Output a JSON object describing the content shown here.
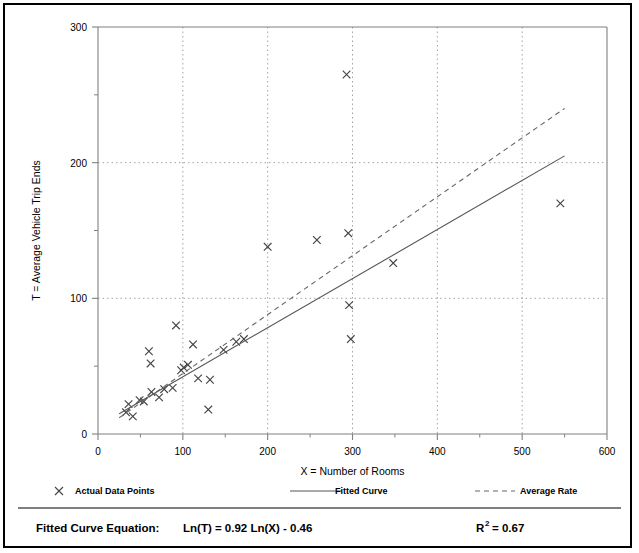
{
  "chart_data": {
    "type": "scatter",
    "title": "",
    "xlabel": "X = Number of Rooms",
    "ylabel": "T = Average Vehicle Trip Ends",
    "xlim": [
      0,
      600
    ],
    "ylim": [
      0,
      300
    ],
    "xticks": [
      0,
      100,
      200,
      300,
      400,
      500,
      600
    ],
    "yticks": [
      0,
      100,
      200,
      300
    ],
    "xminorticks": [
      50,
      150,
      250,
      350,
      450,
      550
    ],
    "yminorticks": [
      50,
      150,
      250
    ],
    "grid": true,
    "grid_style": "dotted",
    "legend_position": "below-axis",
    "series": [
      {
        "name": "Actual Data Points",
        "type": "scatter",
        "marker": "x",
        "points": [
          [
            33,
            16
          ],
          [
            36,
            22
          ],
          [
            41,
            13
          ],
          [
            49,
            25
          ],
          [
            54,
            24
          ],
          [
            60,
            61
          ],
          [
            62,
            52
          ],
          [
            63,
            31
          ],
          [
            72,
            27
          ],
          [
            78,
            33
          ],
          [
            88,
            34
          ],
          [
            92,
            80
          ],
          [
            98,
            47
          ],
          [
            101,
            49
          ],
          [
            106,
            51
          ],
          [
            112,
            66
          ],
          [
            118,
            41
          ],
          [
            130,
            18
          ],
          [
            132,
            40
          ],
          [
            148,
            62
          ],
          [
            163,
            68
          ],
          [
            172,
            70
          ],
          [
            200,
            138
          ],
          [
            258,
            143
          ],
          [
            295,
            148
          ],
          [
            293,
            265
          ],
          [
            296,
            95
          ],
          [
            298,
            70
          ],
          [
            348,
            126
          ],
          [
            545,
            170
          ]
        ]
      },
      {
        "name": "Fitted Curve",
        "type": "line",
        "style": "solid",
        "equation": "Ln(T) = 0.92 Ln(X) - 0.46",
        "points": [
          [
            25,
            15
          ],
          [
            550,
            205
          ]
        ]
      },
      {
        "name": "Average Rate",
        "type": "line",
        "style": "dashed",
        "points": [
          [
            25,
            12
          ],
          [
            550,
            240
          ]
        ]
      }
    ],
    "annotations": {
      "equation_label": "Fitted Curve Equation:",
      "equation_value": "Ln(T) = 0.92 Ln(X) - 0.46",
      "r_squared_symbol": "R",
      "r_squared_exponent": "2",
      "r_squared_value": "= 0.67"
    }
  },
  "legend": {
    "items": [
      {
        "label": "Actual Data Points",
        "marker": "x-marker-icon"
      },
      {
        "label": "Fitted Curve",
        "marker": "solid-line-icon"
      },
      {
        "label": "Average Rate",
        "marker": "dashed-line-icon"
      }
    ]
  },
  "axes": {
    "x_title": "X = Number of Rooms",
    "y_title": "T = Average Vehicle Trip Ends",
    "x_tick_labels": [
      "0",
      "100",
      "200",
      "300",
      "400",
      "500",
      "600"
    ],
    "y_tick_labels": [
      "0",
      "100",
      "200",
      "300"
    ]
  },
  "colors": {
    "frame": "#000000",
    "axis": "#808080",
    "grid": "#999999",
    "marker": "#444444",
    "fitted_line": "#555555",
    "average_line": "#666666"
  }
}
